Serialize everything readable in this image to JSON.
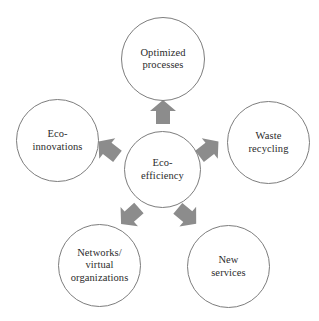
{
  "diagram": {
    "center": {
      "id": "eco-efficiency",
      "label": "Eco-\nefficiency"
    },
    "nodes": [
      {
        "id": "optimized-processes",
        "label": "Optimized\nprocesses"
      },
      {
        "id": "waste-recycling",
        "label": "Waste\nrecycling"
      },
      {
        "id": "new-services",
        "label": "New\nservices"
      },
      {
        "id": "networks-virtual-organizations",
        "label": "Networks/\nvirtual\norganizations"
      },
      {
        "id": "eco-innovations",
        "label": "Eco-\ninnovations"
      }
    ],
    "arrows": [
      {
        "id": "arrow-up",
        "direction": "up",
        "from": "eco-efficiency",
        "to": "optimized-processes"
      },
      {
        "id": "arrow-up-right",
        "direction": "up-right",
        "from": "eco-efficiency",
        "to": "waste-recycling"
      },
      {
        "id": "arrow-down-right",
        "direction": "down-right",
        "from": "eco-efficiency",
        "to": "new-services"
      },
      {
        "id": "arrow-down-left",
        "direction": "down-left",
        "from": "eco-efficiency",
        "to": "networks-virtual-organizations"
      },
      {
        "id": "arrow-up-left",
        "direction": "up-left",
        "from": "eco-efficiency",
        "to": "eco-innovations"
      }
    ],
    "colors": {
      "circle_stroke": "#7d7d7d",
      "arrow_fill": "#8c8c8c",
      "text": "#2b2b2b",
      "background": "#ffffff"
    }
  }
}
